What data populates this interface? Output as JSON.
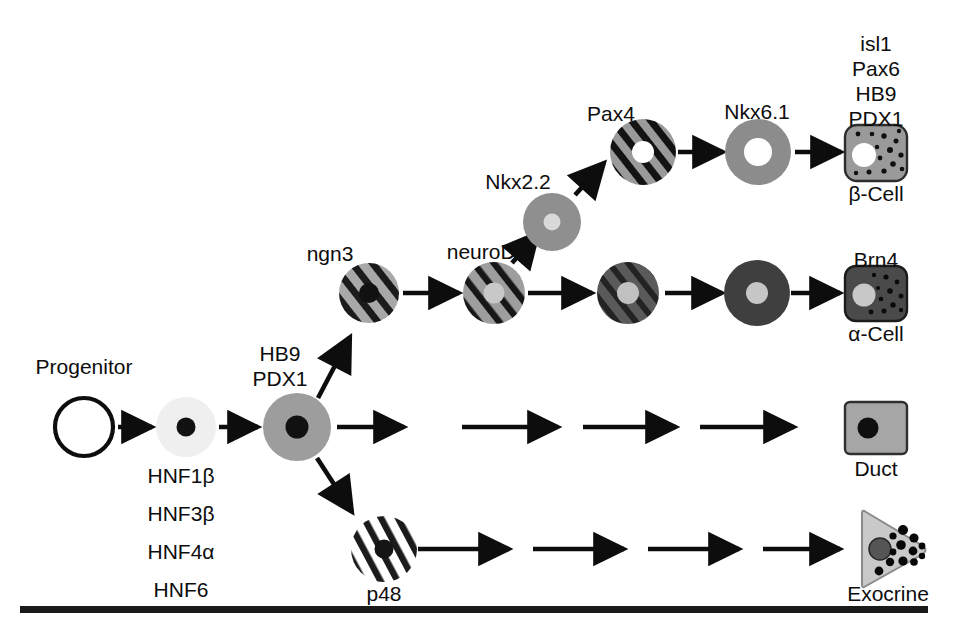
{
  "figure": {
    "title_visible": false,
    "background": "#ffffff",
    "ink": "#0d0d0d",
    "bottom_rule": true
  },
  "palette": {
    "progenitor_fill": "#ffffff",
    "hnf1b_fill": "#efefef",
    "pdx1_fill": "#9d9d9d",
    "ngn3_base": "#a8a8a8",
    "ngn3_stripe": "#1b1b1b",
    "neurod1_base": "#9e9e9e",
    "nkx22_fill": "#8f8f8f",
    "pax4_base": "#9a9a9a",
    "pax4_stripe": "#131313",
    "nkx61_fill": "#8c8c8c",
    "beta_fill": "#9a9a9a",
    "alpha_dark": "#4a4a4a",
    "alpha_darker": "#3c3c3c",
    "duct_fill": "#a6a6a6",
    "exocrine_fill": "#c9c9c9",
    "nucleus_dark": "#111111",
    "nucleus_light": "#c8c8c8",
    "nucleus_white": "#ffffff"
  },
  "labels": {
    "progenitor": "Progenitor",
    "hb9": "HB9",
    "pdx1": "PDX1",
    "ngn3": "ngn3",
    "neurod1": "neuroD1",
    "nkx22": "Nkx2.2",
    "pax4": "Pax4",
    "nkx61": "Nkx6.1",
    "brn4": "Brn4",
    "duct": "Duct",
    "p48": "p48",
    "exocrine": "Exocrine",
    "beta_cell": "β-Cell",
    "alpha_cell": "α-Cell"
  },
  "progenitor_factors": {
    "items": [
      "HNF1β",
      "HNF3β",
      "HNF4α",
      "HNF6"
    ]
  },
  "beta_factors": {
    "items": [
      "isl1",
      "Pax6",
      "HB9",
      "PDX1"
    ]
  },
  "pathway": {
    "name": "Pancreatic cell lineage differentiation",
    "branches": [
      {
        "id": "beta",
        "endpoint": "β-Cell",
        "markers": [
          "ngn3",
          "neuroD1",
          "Nkx2.2",
          "Pax4",
          "Nkx6.1",
          "isl1",
          "Pax6",
          "HB9",
          "PDX1"
        ]
      },
      {
        "id": "alpha",
        "endpoint": "α-Cell",
        "markers": [
          "ngn3",
          "neuroD1",
          "Brn4"
        ]
      },
      {
        "id": "duct",
        "endpoint": "Duct",
        "markers": []
      },
      {
        "id": "exocrine",
        "endpoint": "Exocrine",
        "markers": [
          "p48"
        ]
      }
    ]
  }
}
